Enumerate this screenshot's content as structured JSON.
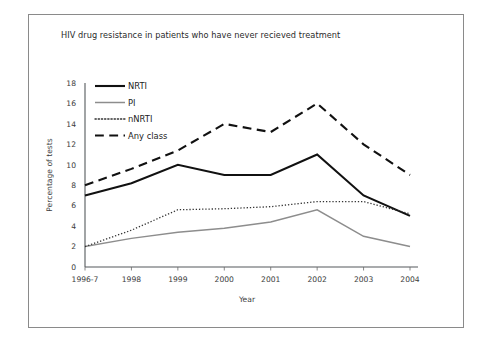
{
  "figure": {
    "frame_border_color": "#8a8a8a",
    "background": "#ffffff"
  },
  "chart_data": {
    "type": "line",
    "title": "HIV drug resistance in patients who have never recieved treatment",
    "xlabel": "Year",
    "ylabel": "Percentage of tests",
    "categories": [
      "1996-7",
      "1998",
      "1999",
      "2000",
      "2001",
      "2002",
      "2003",
      "2004"
    ],
    "x": [
      "1996-7",
      "1998",
      "1999",
      "2000",
      "2001",
      "2002",
      "2003",
      "2004"
    ],
    "ylim": [
      0,
      18
    ],
    "yticks": [
      0,
      2,
      4,
      6,
      8,
      10,
      12,
      14,
      16,
      18
    ],
    "grid": false,
    "legend_position": "top-left",
    "series": [
      {
        "name": "NRTI",
        "values": [
          7.0,
          8.2,
          10.0,
          9.0,
          9.0,
          11.0,
          7.0,
          5.0
        ],
        "color": "#111111",
        "style": "solid",
        "width": 2.1
      },
      {
        "name": "PI",
        "values": [
          2.0,
          2.8,
          3.4,
          3.8,
          4.4,
          5.6,
          3.0,
          2.0
        ],
        "color": "#8d8d8d",
        "style": "solid",
        "width": 1.5
      },
      {
        "name": "nNRTI",
        "values": [
          2.0,
          3.6,
          5.6,
          5.7,
          5.9,
          6.4,
          6.4,
          5.2
        ],
        "color": "#333333",
        "style": "dotted",
        "width": 1.3
      },
      {
        "name": "Any class",
        "values": [
          8.0,
          9.6,
          11.4,
          14.0,
          13.2,
          16.0,
          12.0,
          9.0
        ],
        "color": "#111111",
        "style": "dashed",
        "width": 2.1
      }
    ]
  },
  "legend": {
    "entries": [
      {
        "label": "NRTI"
      },
      {
        "label": "PI"
      },
      {
        "label": "nNRTI"
      },
      {
        "label": "Any class"
      }
    ]
  }
}
